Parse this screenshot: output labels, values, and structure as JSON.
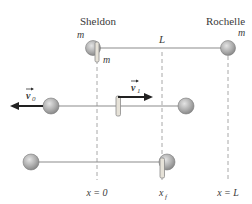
{
  "figure": {
    "people": {
      "left": "Sheldon",
      "right": "Rochelle"
    },
    "mass_labels": {
      "sheldon": "m",
      "cylinder": "m",
      "rochelle": "m"
    },
    "length_label": "L",
    "velocity_labels": {
      "v0": "v",
      "v0_sub": "0",
      "v1": "v",
      "v1_sub": "1"
    },
    "position_labels": {
      "origin": "x = 0",
      "final": "x",
      "final_sub": "f",
      "end": "x = L"
    },
    "colors": {
      "sphere_fill": "#b8b8b8",
      "sphere_stroke": "#7a7a7a",
      "rope": "#8c8c8c",
      "dashed": "#a0a0a0",
      "arrow": "#222222",
      "cylinder_fill": "#e6e2d8",
      "cylinder_stroke": "#8a8a8a",
      "text": "#3a3a3a"
    }
  }
}
